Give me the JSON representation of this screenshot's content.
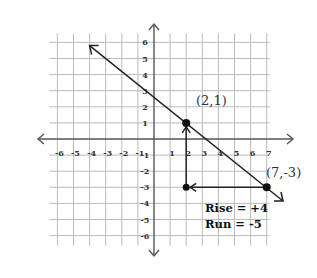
{
  "diagram": {
    "type": "coordinate-plane-slope",
    "grid": {
      "x_min": -6,
      "x_max": 7,
      "y_min": -6,
      "y_max": 6,
      "origin_px": [
        154,
        139
      ],
      "unit_px": 16.1
    },
    "x_ticks": [
      "-6",
      "-5",
      "-4",
      "-3",
      "-2",
      "-1",
      "1",
      "2",
      "3",
      "4",
      "5",
      "6",
      "7"
    ],
    "y_ticks": [
      "6",
      "5",
      "4",
      "3",
      "2",
      "1",
      "-1",
      "-2",
      "-3",
      "-4",
      "-5",
      "-6"
    ],
    "line": {
      "passes_through": [
        [
          2,
          1
        ],
        [
          7,
          -3
        ]
      ],
      "arrow_start": [
        -4,
        5.8
      ],
      "arrow_end": [
        8,
        -4
      ]
    },
    "points": [
      {
        "label": "(2,1)",
        "x": 2,
        "y": 1
      },
      {
        "label": "(7,-3)",
        "x": 7,
        "y": -3
      }
    ],
    "run_segment": {
      "from": [
        7,
        -3
      ],
      "to": [
        2,
        -3
      ]
    },
    "rise_segment": {
      "from": [
        2,
        -3
      ],
      "to": [
        2,
        1
      ]
    },
    "annotations": {
      "rise": "Rise = +4",
      "run": "Run = -5"
    },
    "colors": {
      "grid": "#b8b8b8",
      "axis": "#555555",
      "ink": "#222222"
    }
  }
}
